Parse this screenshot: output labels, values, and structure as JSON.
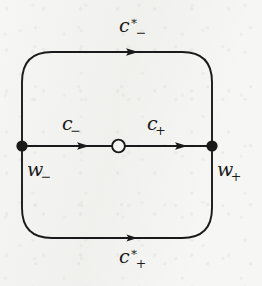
{
  "figure": {
    "kind": "contour-diagram",
    "background_color": "#f6f6f4",
    "ink_color": "#1a1a1a",
    "width": 262,
    "height": 286
  },
  "labels": {
    "top_contour": {
      "base": "c",
      "superscript": "∗",
      "subscript": "−"
    },
    "bottom_contour": {
      "base": "c",
      "superscript": "∗",
      "subscript": "+"
    },
    "middle_left": {
      "base": "c",
      "superscript": "",
      "subscript": "−"
    },
    "middle_right": {
      "base": "c",
      "superscript": "",
      "subscript": "+"
    },
    "left_node": {
      "base": "w",
      "superscript": "",
      "subscript": "−"
    },
    "right_node": {
      "base": "w",
      "superscript": "",
      "subscript": "+"
    }
  },
  "nodes": [
    {
      "name": "w-minus",
      "style": "filled-dot",
      "x": 22,
      "y": 146,
      "radius": 5.5
    },
    {
      "name": "w-plus",
      "style": "filled-dot",
      "x": 212,
      "y": 146,
      "radius": 5.5
    },
    {
      "name": "midpoint",
      "style": "open-circle",
      "x": 118,
      "y": 146,
      "radius": 6.5
    }
  ],
  "edges": [
    {
      "name": "top-arc",
      "from": "w-minus",
      "to": "w-plus",
      "direction": "rightward",
      "arrow_x": 134,
      "arrow_y": 52
    },
    {
      "name": "bottom-arc",
      "from": "w-minus",
      "to": "w-plus",
      "direction": "rightward",
      "arrow_x": 133,
      "arrow_y": 238
    },
    {
      "name": "middle-left-segment",
      "from": "w-minus",
      "to": "midpoint",
      "direction": "rightward",
      "arrow_x": 85,
      "arrow_y": 146
    },
    {
      "name": "middle-right-segment",
      "from": "midpoint",
      "to": "w-plus",
      "direction": "rightward",
      "arrow_x": 183,
      "arrow_y": 146
    }
  ],
  "geometry": {
    "rect_left": 22,
    "rect_right": 212,
    "rect_top": 52,
    "rect_bottom": 238,
    "corner_radius": 30,
    "stroke_width": 1.9
  }
}
